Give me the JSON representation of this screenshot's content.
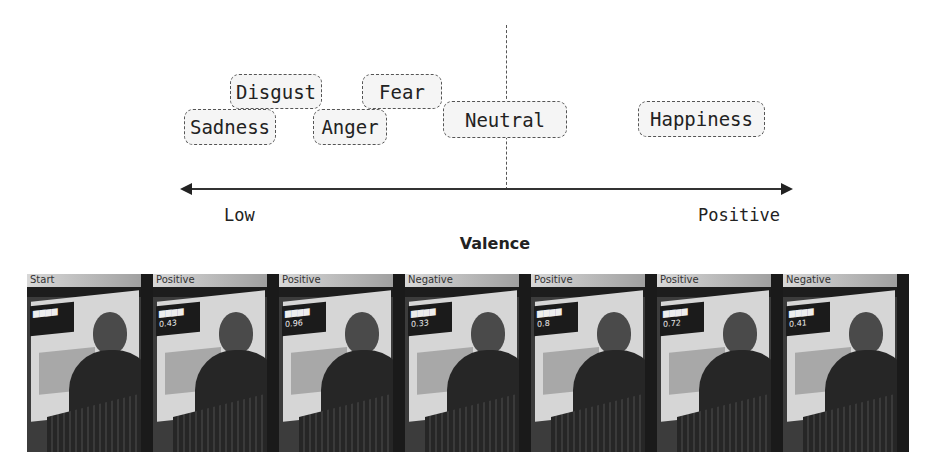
{
  "diagram": {
    "emotions": [
      {
        "label": "Disgust",
        "x": 230,
        "y": 74,
        "w": 92,
        "h": 35
      },
      {
        "label": "Sadness",
        "x": 184,
        "y": 109,
        "w": 92,
        "h": 36
      },
      {
        "label": "Fear",
        "x": 362,
        "y": 74,
        "w": 80,
        "h": 35
      },
      {
        "label": "Anger",
        "x": 313,
        "y": 109,
        "w": 74,
        "h": 36
      },
      {
        "label": "Neutral",
        "x": 443,
        "y": 101,
        "w": 124,
        "h": 37
      },
      {
        "label": "Happiness",
        "x": 638,
        "y": 101,
        "w": 127,
        "h": 36
      }
    ],
    "axis": {
      "low_label": "Low",
      "high_label": "Positive",
      "title": "Valence"
    }
  },
  "video_strip": {
    "frames": [
      {
        "label": "Start",
        "overlay_value": ""
      },
      {
        "label": "Positive",
        "overlay_value": "0.43"
      },
      {
        "label": "Positive",
        "overlay_value": "0.96"
      },
      {
        "label": "Negative",
        "overlay_value": "0.33"
      },
      {
        "label": "Positive",
        "overlay_value": "0.8"
      },
      {
        "label": "Positive",
        "overlay_value": "0.72"
      },
      {
        "label": "Negative",
        "overlay_value": "0.41"
      }
    ]
  },
  "colors": {
    "stroke": "#555555",
    "box_fill": "#f5f5f5",
    "text": "#222222"
  }
}
